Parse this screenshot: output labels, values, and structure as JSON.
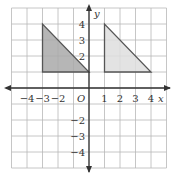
{
  "graph": {
    "x_axis_label": "x",
    "y_axis_label": "y",
    "origin_label": "O",
    "x_range": [
      -5,
      5
    ],
    "y_range": [
      -5,
      5
    ],
    "x_tick_labels": [
      {
        "value": -4,
        "text": "−4"
      },
      {
        "value": -3,
        "text": "−3"
      },
      {
        "value": -2,
        "text": "−2"
      },
      {
        "value": 1,
        "text": "1"
      },
      {
        "value": 2,
        "text": "2"
      },
      {
        "value": 3,
        "text": "3"
      },
      {
        "value": 4,
        "text": "4"
      }
    ],
    "y_tick_labels": [
      {
        "value": 4,
        "text": "4"
      },
      {
        "value": 3,
        "text": "3"
      },
      {
        "value": 2,
        "text": "2"
      },
      {
        "value": -2,
        "text": "−2"
      },
      {
        "value": -3,
        "text": "−3"
      },
      {
        "value": -4,
        "text": "−4"
      }
    ],
    "shapes": [
      {
        "name": "triangle-left",
        "vertices": [
          [
            -3,
            4
          ],
          [
            -3,
            1
          ],
          [
            0,
            1
          ]
        ],
        "fill": "#a9a9a9",
        "stroke": "#555555"
      },
      {
        "name": "triangle-right",
        "vertices": [
          [
            1,
            4
          ],
          [
            1,
            1
          ],
          [
            4,
            1
          ]
        ],
        "fill": "#dedede",
        "stroke": "#555555"
      }
    ],
    "colors": {
      "grid": "#b8b8b8",
      "axis": "#333333"
    }
  }
}
